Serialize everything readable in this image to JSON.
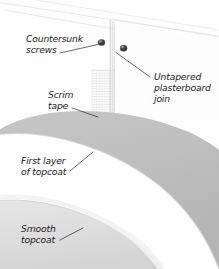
{
  "figure": {
    "background_color": "#fefefe",
    "width": 219,
    "height": 269
  },
  "labels": [
    {
      "id": "countersunk-screws",
      "line1": "Countersunk",
      "line2": "screws",
      "x": 26,
      "y": 42,
      "align": "start"
    },
    {
      "id": "untapered-plasterboard-join",
      "line1": "Untapered",
      "line2": "plasterboard",
      "line3": "join",
      "x": 154,
      "y": 80,
      "align": "start"
    },
    {
      "id": "scrim-tape",
      "line1": "Scrim",
      "line2": "tape",
      "x": 48,
      "y": 98,
      "align": "start"
    },
    {
      "id": "first-layer-of-topcoat",
      "line1": "First layer",
      "line2": "of topcoat",
      "x": 21,
      "y": 164,
      "align": "start"
    },
    {
      "id": "smooth-topcoat",
      "line1": "Smooth",
      "line2": "topcoat",
      "x": 21,
      "y": 232,
      "align": "start"
    }
  ],
  "parts": {
    "screw_left": {
      "cx": 101.5,
      "cy": 42.5,
      "r": 3.4
    },
    "screw_right": {
      "cx": 123.5,
      "cy": 48.0,
      "r": 3.4
    },
    "join_line": {
      "x": 110.5,
      "y1": 20,
      "y2": 118
    },
    "scrim_tape": {
      "x": 92,
      "y": 70,
      "width": 44,
      "height": 68
    }
  },
  "colors": {
    "ink": "#1a1a1a",
    "leader": "#2a2a2a",
    "screw_dark": "#3b3b3b",
    "screw_highlight": "#8e8e8e",
    "first_topcoat_dark": "#bdbdbd",
    "first_topcoat_mid": "#c9c9c9",
    "smooth_topcoat_light": "#e0e0e0",
    "smooth_topcoat_pale": "#ededed",
    "mesh": "#c8c8c8",
    "board_edge": "#c4c4c4",
    "background": "#fefefe"
  }
}
